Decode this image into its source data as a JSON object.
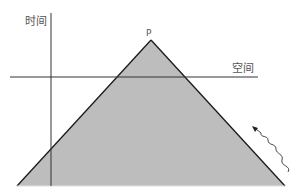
{
  "diagram": {
    "type": "light-cone",
    "labels": {
      "time_axis": "时间",
      "space_axis": "空间",
      "apex": "P"
    },
    "colors": {
      "cone_fill": "#bdbdbd",
      "cone_edge": "#1a1a1a",
      "axis": "#333333",
      "label": "#555555",
      "wave": "#333333"
    },
    "geometry": {
      "apex": [
        151,
        40
      ],
      "base_left": [
        17,
        186
      ],
      "base_right": [
        285,
        186
      ],
      "time_axis": {
        "x": 51,
        "y1": 13,
        "y2": 186
      },
      "space_axis": {
        "y": 77,
        "x1": 10,
        "x2": 258
      }
    }
  }
}
